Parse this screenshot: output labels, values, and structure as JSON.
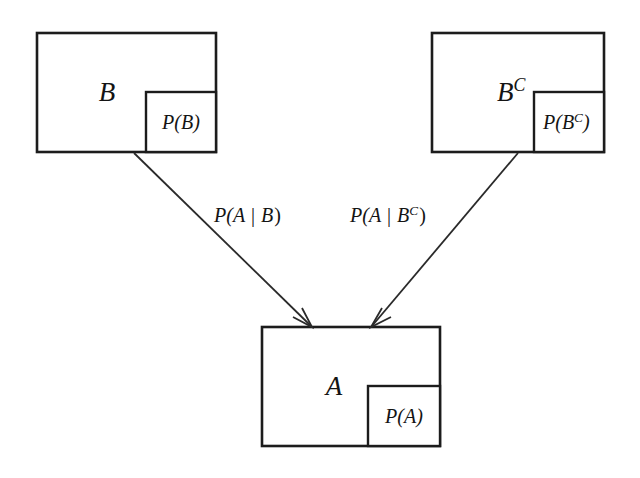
{
  "diagram": {
    "nodes": [
      {
        "id": "node-b",
        "set_label": "B",
        "set_label_base": "B",
        "set_label_sup": "",
        "prob_label": "P(B)",
        "prob_label_base": "P(B)",
        "prob_label_sup": ""
      },
      {
        "id": "node-bc",
        "set_label": "B^C",
        "set_label_base": "B",
        "set_label_sup": "C",
        "prob_label": "P(B^C)",
        "prob_label_prefix": "P(B",
        "prob_label_sup": "C",
        "prob_label_suffix": ")"
      },
      {
        "id": "node-a",
        "set_label": "A",
        "set_label_base": "A",
        "set_label_sup": "",
        "prob_label": "P(A)",
        "prob_label_base": "P(A)",
        "prob_label_sup": ""
      }
    ],
    "edges": [
      {
        "id": "edge-b-to-a",
        "from": "node-b",
        "to": "node-a",
        "label": "P(A | B)",
        "label_prefix": "P(A",
        "label_bar": "|",
        "label_middle": "B",
        "label_sup": "",
        "label_suffix": ")"
      },
      {
        "id": "edge-bc-to-a",
        "from": "node-bc",
        "to": "node-a",
        "label": "P(A | B^C)",
        "label_prefix": "P(A",
        "label_bar": "|",
        "label_middle": "B",
        "label_sup": "C",
        "label_suffix": ")"
      }
    ],
    "colors": {
      "background": "#ffffff",
      "stroke": "#1c1c1c",
      "line": "#2a2a2a",
      "text": "#141414"
    }
  }
}
